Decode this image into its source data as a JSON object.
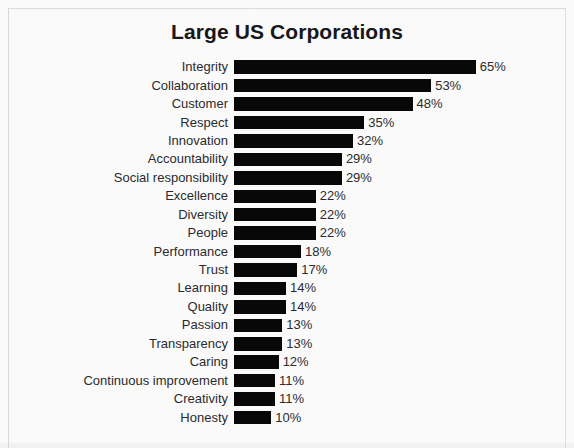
{
  "chart_data": {
    "type": "bar",
    "orientation": "horizontal",
    "title": "Large US Corporations",
    "xlabel": "",
    "ylabel": "",
    "xlim": [
      0,
      65
    ],
    "grid": false,
    "legend": null,
    "value_suffix": "%",
    "categories": [
      "Integrity",
      "Collaboration",
      "Customer",
      "Respect",
      "Innovation",
      "Accountability",
      "Social responsibility",
      "Excellence",
      "Diversity",
      "People",
      "Performance",
      "Trust",
      "Learning",
      "Quality",
      "Passion",
      "Transparency",
      "Caring",
      "Continuous improvement",
      "Creativity",
      "Honesty"
    ],
    "values": [
      65,
      53,
      48,
      35,
      32,
      29,
      29,
      22,
      22,
      22,
      18,
      17,
      14,
      14,
      13,
      13,
      12,
      11,
      11,
      10
    ],
    "data_labels": [
      "65%",
      "53%",
      "48%",
      "35%",
      "32%",
      "29%",
      "29%",
      "22%",
      "22%",
      "22%",
      "18%",
      "17%",
      "14%",
      "14%",
      "13%",
      "13%",
      "12%",
      "11%",
      "11%",
      "10%"
    ],
    "colors": {
      "bar": "#080808",
      "text": "#2b2b2e",
      "title": "#17171a",
      "background": "#f4f4f3",
      "frame": "#dcdcda"
    },
    "px_per_unit": 3.72
  }
}
